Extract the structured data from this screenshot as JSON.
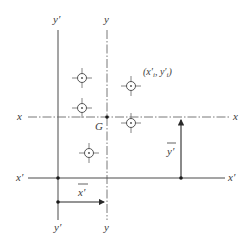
{
  "diagram": {
    "type": "centroid-axes-parallel-axis-theorem",
    "colors": {
      "line": "#4a4a4a",
      "text": "#3a3a3a",
      "background": "#ffffff"
    },
    "axes": {
      "y_prime": {
        "label_top": "y′",
        "label_bottom": "y′",
        "style": "solid"
      },
      "y": {
        "label_top": "y",
        "label_bottom": "y",
        "style": "dash-dot"
      },
      "x": {
        "label_left": "x",
        "label_right": "x",
        "style": "dash-dot"
      },
      "x_prime": {
        "label_left": "x′",
        "label_right": "x′",
        "style": "solid"
      }
    },
    "centroid": {
      "label": "G"
    },
    "particle_label": {
      "text": "(x′ᵢ, y′ᵢ)",
      "x_part": "(x′",
      "x_sub": "i",
      "sep": ", y′",
      "y_sub": "i",
      "close": ")"
    },
    "particles": [
      {
        "cx": 82,
        "cy": 78
      },
      {
        "cx": 131,
        "cy": 86
      },
      {
        "cx": 82,
        "cy": 108
      },
      {
        "cx": 131,
        "cy": 123
      },
      {
        "cx": 89,
        "cy": 153
      }
    ],
    "dimensions": {
      "x_bar": {
        "label": "x̄′",
        "base": "x",
        "mark": "′"
      },
      "y_bar": {
        "label": "ȳ′",
        "base": "y",
        "mark": "′"
      }
    }
  }
}
